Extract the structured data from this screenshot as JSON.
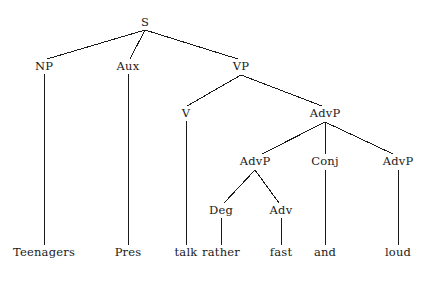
{
  "figure": {
    "type": "syntax-tree",
    "sentence": "Teenagers Pres talk rather fast and loud",
    "background_color": "#ffffff",
    "line_color": "#1a1a1a",
    "text_color": "#1a1a1a"
  },
  "nodes": [
    {
      "id": "S",
      "label": "S",
      "x": 145,
      "y": 23,
      "kind": "nonterminal"
    },
    {
      "id": "NP",
      "label": "NP",
      "x": 44,
      "y": 67,
      "kind": "nonterminal"
    },
    {
      "id": "Aux",
      "label": "Aux",
      "x": 128,
      "y": 67,
      "kind": "nonterminal"
    },
    {
      "id": "VP",
      "label": "VP",
      "x": 241,
      "y": 67,
      "kind": "nonterminal"
    },
    {
      "id": "V",
      "label": "V",
      "x": 186,
      "y": 114,
      "kind": "nonterminal"
    },
    {
      "id": "AdvP1",
      "label": "AdvP",
      "x": 325,
      "y": 114,
      "kind": "nonterminal"
    },
    {
      "id": "AdvP2",
      "label": "AdvP",
      "x": 255,
      "y": 162,
      "kind": "nonterminal"
    },
    {
      "id": "Conj",
      "label": "Conj",
      "x": 325,
      "y": 162,
      "kind": "nonterminal"
    },
    {
      "id": "AdvP3",
      "label": "AdvP",
      "x": 398,
      "y": 162,
      "kind": "nonterminal"
    },
    {
      "id": "Deg",
      "label": "Deg",
      "x": 221,
      "y": 211,
      "kind": "nonterminal"
    },
    {
      "id": "Adv",
      "label": "Adv",
      "x": 281,
      "y": 211,
      "kind": "nonterminal"
    },
    {
      "id": "w1",
      "label": "Teenagers",
      "x": 44,
      "y": 253,
      "kind": "terminal"
    },
    {
      "id": "w2",
      "label": "Pres",
      "x": 128,
      "y": 253,
      "kind": "terminal"
    },
    {
      "id": "w3",
      "label": "talk",
      "x": 186,
      "y": 253,
      "kind": "terminal"
    },
    {
      "id": "w4",
      "label": "rather",
      "x": 221,
      "y": 253,
      "kind": "terminal"
    },
    {
      "id": "w5",
      "label": "fast",
      "x": 281,
      "y": 253,
      "kind": "terminal"
    },
    {
      "id": "w6",
      "label": "and",
      "x": 325,
      "y": 253,
      "kind": "terminal"
    },
    {
      "id": "w7",
      "label": "loud",
      "x": 398,
      "y": 253,
      "kind": "terminal"
    }
  ],
  "edges": [
    {
      "from": "S",
      "to": "NP",
      "x1": 145,
      "y1": 30,
      "x2": 47,
      "y2": 59
    },
    {
      "from": "S",
      "to": "Aux",
      "x1": 145,
      "y1": 30,
      "x2": 130,
      "y2": 59
    },
    {
      "from": "S",
      "to": "VP",
      "x1": 145,
      "y1": 30,
      "x2": 238,
      "y2": 59
    },
    {
      "from": "NP",
      "to": "w1",
      "x1": 44,
      "y1": 74,
      "x2": 44,
      "y2": 245
    },
    {
      "from": "Aux",
      "to": "w2",
      "x1": 128,
      "y1": 74,
      "x2": 128,
      "y2": 245
    },
    {
      "from": "VP",
      "to": "V",
      "x1": 241,
      "y1": 75,
      "x2": 187,
      "y2": 106
    },
    {
      "from": "VP",
      "to": "AdvP1",
      "x1": 241,
      "y1": 75,
      "x2": 322,
      "y2": 106
    },
    {
      "from": "V",
      "to": "w3",
      "x1": 186,
      "y1": 121,
      "x2": 186,
      "y2": 245
    },
    {
      "from": "AdvP1",
      "to": "AdvP2",
      "x1": 325,
      "y1": 122,
      "x2": 262,
      "y2": 154
    },
    {
      "from": "AdvP1",
      "to": "Conj",
      "x1": 325,
      "y1": 122,
      "x2": 325,
      "y2": 154
    },
    {
      "from": "AdvP1",
      "to": "AdvP3",
      "x1": 325,
      "y1": 122,
      "x2": 393,
      "y2": 154
    },
    {
      "from": "AdvP2",
      "to": "Deg",
      "x1": 255,
      "y1": 170,
      "x2": 224,
      "y2": 203
    },
    {
      "from": "AdvP2",
      "to": "Adv",
      "x1": 255,
      "y1": 170,
      "x2": 279,
      "y2": 203
    },
    {
      "from": "Conj",
      "to": "w6",
      "x1": 325,
      "y1": 170,
      "x2": 325,
      "y2": 245
    },
    {
      "from": "AdvP3",
      "to": "w7",
      "x1": 398,
      "y1": 170,
      "x2": 398,
      "y2": 245
    },
    {
      "from": "Deg",
      "to": "w4",
      "x1": 221,
      "y1": 218,
      "x2": 221,
      "y2": 245
    },
    {
      "from": "Adv",
      "to": "w5",
      "x1": 281,
      "y1": 218,
      "x2": 281,
      "y2": 245
    }
  ]
}
